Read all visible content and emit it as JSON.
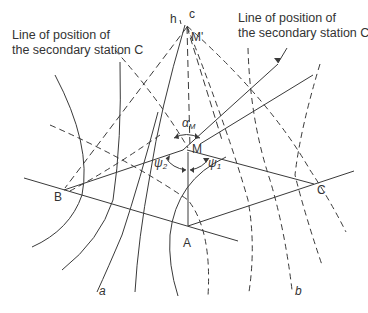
{
  "figure": {
    "caption_left": {
      "line1": "Line of position of",
      "line2": "the secondary station C"
    },
    "caption_right": {
      "line1": "Line of position of",
      "line2": "the secondary station C"
    },
    "points": {
      "A": "A",
      "B": "B",
      "C": "C",
      "M": "M",
      "M_prime": "M'"
    },
    "line_labels": {
      "h": "h",
      "c": "c",
      "a": "a",
      "b": "b"
    },
    "angles": {
      "alpha": "α",
      "alpha_sub": "M",
      "psi1": "ψ",
      "psi1_sub": "1",
      "psi2": "ψ",
      "psi2_sub": "2"
    },
    "colors": {
      "line": "#3a3a3a",
      "text": "#333333",
      "background": "#ffffff"
    }
  }
}
